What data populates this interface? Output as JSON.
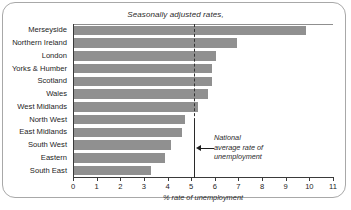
{
  "chart_data": {
    "type": "bar",
    "orientation": "horizontal",
    "title": "Seasonally adjusted rates,",
    "xlabel": "% rate of unemployment",
    "ylabel": "",
    "xlim": [
      0,
      11
    ],
    "xticks": [
      0,
      1,
      2,
      3,
      4,
      5,
      6,
      7,
      8,
      9,
      10,
      11
    ],
    "xtick_labels": [
      "0",
      "1",
      "2",
      "3",
      "4",
      "5",
      "6",
      "7",
      "8",
      "9",
      "10",
      "11"
    ],
    "grid": false,
    "legend": "none",
    "bar_color": "#909090",
    "categories": [
      "Merseyside",
      "Northern Ireland",
      "London",
      "Yorks & Humber",
      "Scotland",
      "Wales",
      "West Midlands",
      "North West",
      "East Midlands",
      "South West",
      "Eastern",
      "South East"
    ],
    "values": [
      9.8,
      6.9,
      6.0,
      5.85,
      5.85,
      5.65,
      5.25,
      4.7,
      4.55,
      4.1,
      3.85,
      3.25
    ],
    "annotations": [
      {
        "name": "national-average-line",
        "value": 5.1,
        "label_lines": [
          "National",
          "average rate of",
          "unemployment"
        ],
        "arrow": "left"
      }
    ]
  },
  "annotation": {
    "line1": "National",
    "line2": "average rate of",
    "line3": "unemployment"
  }
}
